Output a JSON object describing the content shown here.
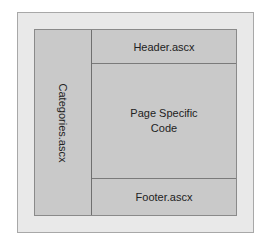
{
  "diagram": {
    "sidebar": {
      "label": "Categories.ascx"
    },
    "header": {
      "label": "Header.ascx"
    },
    "content": {
      "line1": "Page Specific",
      "line2": "Code"
    },
    "footer": {
      "label": "Footer.ascx"
    }
  }
}
